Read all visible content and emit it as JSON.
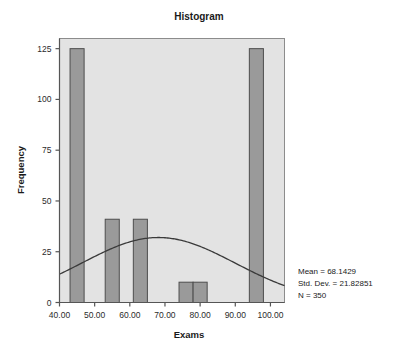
{
  "chart_data": {
    "type": "bar",
    "title": "Histogram",
    "xlabel": "Exams",
    "ylabel": "Frequency",
    "xlim": [
      40,
      104
    ],
    "ylim": [
      0,
      130
    ],
    "grid": false,
    "legend": null,
    "xticks": [
      "40.00",
      "50.00",
      "60.00",
      "70.00",
      "80.00",
      "90.00",
      "100.00"
    ],
    "xtick_values": [
      40,
      50,
      60,
      70,
      80,
      90,
      100
    ],
    "yticks": [
      "0",
      "25",
      "50",
      "75",
      "100",
      "125"
    ],
    "ytick_values": [
      0,
      25,
      50,
      75,
      100,
      125
    ],
    "bars": [
      {
        "x_start": 43,
        "x_end": 47,
        "value": 125
      },
      {
        "x_start": 53,
        "x_end": 57,
        "value": 41
      },
      {
        "x_start": 61,
        "x_end": 65,
        "value": 41
      },
      {
        "x_start": 74,
        "x_end": 78,
        "value": 10
      },
      {
        "x_start": 78,
        "x_end": 82,
        "value": 10
      },
      {
        "x_start": 94,
        "x_end": 98,
        "value": 125
      }
    ],
    "normal_curve": {
      "mean": 68.1429,
      "std_dev": 21.82851,
      "n": 350,
      "peak_value": 32,
      "visible": true
    },
    "annotations": [
      "Mean = 68.1429",
      "Std. Dev. = 21.82851",
      "N = 350"
    ],
    "colors": {
      "bar_fill": "#9a9a9a",
      "bar_stroke": "#4d4d4d",
      "plot_background": "#e3e3e3",
      "page_background": "#ffffff",
      "curve": "#3a3a3a",
      "axis": "#555555",
      "text": "#1a1a1a"
    }
  }
}
